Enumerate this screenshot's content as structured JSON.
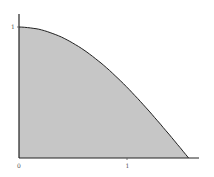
{
  "chart_data": {
    "type": "area",
    "title": "",
    "xlabel": "",
    "ylabel": "",
    "function": "y = cos(x)",
    "x": [
      0,
      0.1963,
      0.3927,
      0.589,
      0.7854,
      0.9817,
      1.1781,
      1.3744,
      1.5708
    ],
    "values": [
      1,
      0.9808,
      0.9239,
      0.8315,
      0.7071,
      0.5556,
      0.3827,
      0.1951,
      0
    ],
    "xlim": [
      0,
      1.65
    ],
    "ylim": [
      0,
      1.1
    ],
    "x_ticks": [
      {
        "value": 0,
        "label": "0"
      },
      {
        "value": 1,
        "label": "1"
      }
    ],
    "y_ticks": [
      {
        "value": 1,
        "label": "1"
      }
    ],
    "grid": false,
    "legend": null,
    "fill_color": "#c8c8c8",
    "line_color": "#222222"
  }
}
